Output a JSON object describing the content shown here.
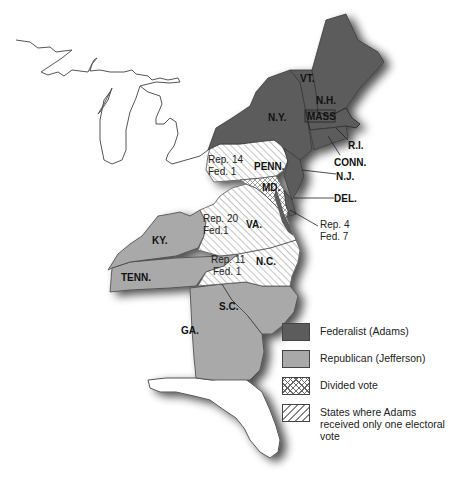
{
  "map": {
    "title": "Election of 1796",
    "states": [
      {
        "name": "VT.",
        "result": "federalist"
      },
      {
        "name": "N.H.",
        "result": "federalist"
      },
      {
        "name": "MASS",
        "result": "federalist"
      },
      {
        "name": "N.Y.",
        "result": "federalist"
      },
      {
        "name": "R.I.",
        "result": "federalist"
      },
      {
        "name": "CONN.",
        "result": "federalist"
      },
      {
        "name": "N.J.",
        "result": "federalist"
      },
      {
        "name": "DEL.",
        "result": "federalist"
      },
      {
        "name": "PENN.",
        "result": "one_electoral_vote",
        "note": [
          "Rep. 14",
          "Fed. 1"
        ]
      },
      {
        "name": "MD.",
        "result": "divided",
        "note": [
          "Rep. 4",
          "Fed. 7"
        ]
      },
      {
        "name": "VA.",
        "result": "one_electoral_vote",
        "note": [
          "Rep. 20",
          "Fed.1"
        ]
      },
      {
        "name": "N.C.",
        "result": "one_electoral_vote",
        "note": [
          "Rep. 11",
          "Fed. 1"
        ]
      },
      {
        "name": "KY.",
        "result": "republican"
      },
      {
        "name": "TENN.",
        "result": "republican"
      },
      {
        "name": "S.C.",
        "result": "republican"
      },
      {
        "name": "GA.",
        "result": "republican"
      }
    ],
    "labels": {
      "vt": "VT.",
      "nh": "N.H.",
      "mass": "MASS",
      "ny": "N.Y.",
      "ri": "R.I.",
      "conn": "CONN.",
      "nj": "N.J.",
      "del": "DEL.",
      "penn": "PENN.",
      "md": "MD.",
      "va": "VA.",
      "nc": "N.C.",
      "ky": "KY.",
      "tenn": "TENN.",
      "sc": "S.C.",
      "ga": "GA.",
      "penn_rep": "Rep. 14",
      "penn_fed": "Fed. 1",
      "va_rep": "Rep. 20",
      "va_fed": "Fed.1",
      "nc_rep": "Rep. 11",
      "nc_fed": "Fed. 1",
      "md_rep": "Rep. 4",
      "md_fed": "Fed. 7"
    },
    "colors": {
      "federalist": "#5c5c5c",
      "republican": "#a9a9a9",
      "hatch": "#888888"
    }
  },
  "legend": {
    "items": [
      {
        "key": "federalist",
        "label": "Federalist (Adams)"
      },
      {
        "key": "republican",
        "label": "Republican (Jefferson)"
      },
      {
        "key": "divided",
        "label": "Divided vote"
      },
      {
        "key": "one_vote",
        "label": "States where Adams received only one electoral vote"
      }
    ]
  }
}
